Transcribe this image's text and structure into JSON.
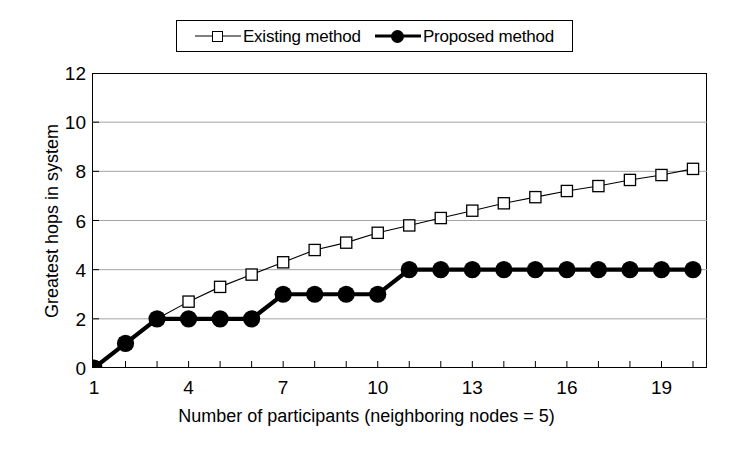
{
  "chart_data": {
    "type": "line",
    "title": "",
    "xlabel": "Number of participants (neighboring nodes = 5)",
    "ylabel": "Greatest hops in system",
    "xlim": [
      1,
      20
    ],
    "ylim": [
      0,
      12
    ],
    "xticks": [
      1,
      4,
      7,
      10,
      13,
      16,
      19
    ],
    "yticks": [
      0,
      2,
      4,
      6,
      8,
      10,
      12
    ],
    "grid": "horizontal",
    "legend_position": "top-center",
    "x": [
      1,
      2,
      3,
      4,
      5,
      6,
      7,
      8,
      9,
      10,
      11,
      12,
      13,
      14,
      15,
      16,
      17,
      18,
      19,
      20
    ],
    "series": [
      {
        "name": "Existing method",
        "marker": "open-square",
        "line": "thin",
        "color": "#000000",
        "values": [
          0,
          1,
          2,
          2.7,
          3.3,
          3.8,
          4.3,
          4.8,
          5.1,
          5.5,
          5.8,
          6.1,
          6.4,
          6.7,
          6.95,
          7.2,
          7.4,
          7.65,
          7.85,
          8.1
        ]
      },
      {
        "name": "Proposed method",
        "marker": "filled-circle",
        "line": "thick",
        "color": "#000000",
        "values": [
          0,
          1,
          2,
          2,
          2,
          2,
          3,
          3,
          3,
          3,
          4,
          4,
          4,
          4,
          4,
          4,
          4,
          4,
          4,
          4
        ]
      }
    ]
  },
  "legend": {
    "entries": [
      {
        "label": "Existing method"
      },
      {
        "label": "Proposed method"
      }
    ]
  },
  "axes": {
    "y_title": "Greatest hops in system",
    "x_title": "Number of participants (neighboring nodes = 5)",
    "y_tick_labels": [
      "12",
      "10",
      "8",
      "6",
      "4",
      "2",
      "0"
    ],
    "x_tick_labels": [
      "1",
      "4",
      "7",
      "10",
      "13",
      "16",
      "19"
    ]
  }
}
